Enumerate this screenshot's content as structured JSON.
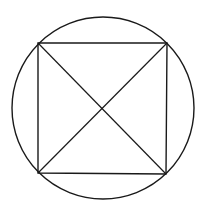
{
  "diagram": {
    "stroke_color": "#1a1a1a",
    "background": "#ffffff",
    "circle": {
      "cx": 103,
      "cy": 108,
      "r": 91
    },
    "square": {
      "vertices": [
        {
          "name": "top-left",
          "x": 38,
          "y": 43
        },
        {
          "name": "top-right",
          "x": 167,
          "y": 43
        },
        {
          "name": "bottom-right",
          "x": 166,
          "y": 174
        },
        {
          "name": "bottom-left",
          "x": 38,
          "y": 173
        }
      ]
    },
    "diagonals": [
      {
        "from": "top-left",
        "to": "bottom-right"
      },
      {
        "from": "top-right",
        "to": "bottom-left"
      }
    ]
  }
}
